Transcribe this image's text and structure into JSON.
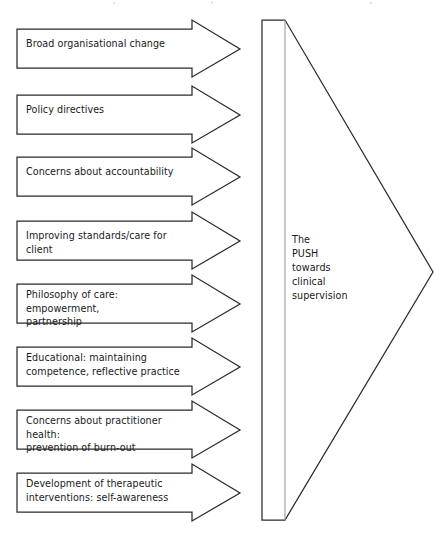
{
  "diagram": {
    "type": "flow-diagram",
    "title_visible": false,
    "background_color": "#ffffff",
    "line_color": "#2b2b2b",
    "text_color": "#1a1a1a",
    "spine_color": "#9a9a9a",
    "drivers": [
      {
        "index": 1,
        "label": "Broad organisational change",
        "lines": 1,
        "body": {
          "x": 17,
          "y": 29,
          "w": 176,
          "h": 39
        },
        "head": {
          "notch_x": 192,
          "tip_x": 240,
          "flare_top": 20,
          "flare_bottom": 77
        },
        "text": {
          "x": 26,
          "y": 43
        }
      },
      {
        "index": 2,
        "label": "Policy directives",
        "lines": 1,
        "body": {
          "x": 17,
          "y": 95,
          "w": 176,
          "h": 39
        },
        "head": {
          "notch_x": 192,
          "tip_x": 240,
          "flare_top": 86,
          "flare_bottom": 143
        },
        "text": {
          "x": 26,
          "y": 109
        }
      },
      {
        "index": 3,
        "label": "Concerns about accountability",
        "lines": 1,
        "body": {
          "x": 17,
          "y": 157,
          "w": 176,
          "h": 39
        },
        "head": {
          "notch_x": 192,
          "tip_x": 240,
          "flare_top": 148,
          "flare_bottom": 205
        },
        "text": {
          "x": 26,
          "y": 171
        }
      },
      {
        "index": 4,
        "label": "Improving standards/care for client",
        "lines": 1,
        "body": {
          "x": 17,
          "y": 221,
          "w": 176,
          "h": 39
        },
        "head": {
          "notch_x": 192,
          "tip_x": 240,
          "flare_top": 212,
          "flare_bottom": 269
        },
        "text": {
          "x": 26,
          "y": 235
        }
      },
      {
        "index": 5,
        "label": "Philosophy of care: empowerment,\npartnership",
        "lines": 2,
        "body": {
          "x": 17,
          "y": 284,
          "w": 176,
          "h": 39
        },
        "head": {
          "notch_x": 192,
          "tip_x": 240,
          "flare_top": 275,
          "flare_bottom": 332
        },
        "text": {
          "x": 26,
          "y": 291
        }
      },
      {
        "index": 6,
        "label": "Educational: maintaining\ncompetence, reflective practice",
        "lines": 2,
        "body": {
          "x": 17,
          "y": 347,
          "w": 176,
          "h": 39
        },
        "head": {
          "notch_x": 192,
          "tip_x": 240,
          "flare_top": 338,
          "flare_bottom": 395
        },
        "text": {
          "x": 26,
          "y": 354
        }
      },
      {
        "index": 7,
        "label": "Concerns about practitioner health:\nprevention of burn-out",
        "lines": 2,
        "body": {
          "x": 17,
          "y": 410,
          "w": 176,
          "h": 39
        },
        "head": {
          "notch_x": 192,
          "tip_x": 240,
          "flare_top": 401,
          "flare_bottom": 458
        },
        "text": {
          "x": 26,
          "y": 417
        }
      },
      {
        "index": 8,
        "label": "Development of therapeutic\ninterventions: self-awareness",
        "lines": 2,
        "body": {
          "x": 17,
          "y": 473,
          "w": 176,
          "h": 39
        },
        "head": {
          "notch_x": 192,
          "tip_x": 240,
          "flare_top": 464,
          "flare_bottom": 521
        },
        "text": {
          "x": 26,
          "y": 480
        }
      }
    ],
    "target": {
      "name": "push-wedge",
      "label": "The\nPUSH\ntowards\nclinical\nsupervision",
      "label_lines": [
        "The",
        "PUSH",
        "towards",
        "clinical",
        "supervision"
      ],
      "geometry": {
        "left_x": 262,
        "spine_x": 285,
        "top_y": 20,
        "bottom_y": 520,
        "apex_x": 433,
        "apex_y": 272
      }
    }
  }
}
